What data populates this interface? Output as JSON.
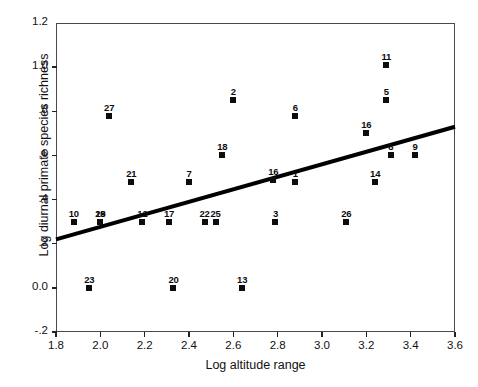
{
  "chart_data": {
    "type": "scatter",
    "title": "",
    "xlabel": "Log altitude range",
    "ylabel": "Log diurnal primate species richness",
    "xlim": [
      1.8,
      3.6
    ],
    "ylim": [
      -0.2,
      1.2
    ],
    "xticks": [
      "1.8",
      "2.0",
      "2.2",
      "2.4",
      "2.6",
      "2.8",
      "3.0",
      "3.2",
      "3.4",
      "3.6"
    ],
    "xtick_values": [
      1.8,
      2.0,
      2.2,
      2.4,
      2.6,
      2.8,
      3.0,
      3.2,
      3.4,
      3.6
    ],
    "yticks": [
      "1.2",
      "1.0",
      ".8",
      ".6",
      ".4",
      ".2",
      "0.0",
      "-.2"
    ],
    "ytick_values": [
      1.2,
      1.0,
      0.8,
      0.6,
      0.4,
      0.2,
      0.0,
      -0.2
    ],
    "grid": false,
    "legend": null,
    "marker": "filled-square",
    "marker_color": "#0d0d0d",
    "point_labels_shown": true,
    "points": [
      {
        "label": "10",
        "x": 1.88,
        "y": 0.3
      },
      {
        "label": "19",
        "x": 2.0,
        "y": 0.3
      },
      {
        "label": "28",
        "x": 2.0,
        "y": 0.3
      },
      {
        "label": "27",
        "x": 2.04,
        "y": 0.78
      },
      {
        "label": "23",
        "x": 1.95,
        "y": 0.0
      },
      {
        "label": "21",
        "x": 2.14,
        "y": 0.48
      },
      {
        "label": "12",
        "x": 2.19,
        "y": 0.3
      },
      {
        "label": "17",
        "x": 2.31,
        "y": 0.3
      },
      {
        "label": "20",
        "x": 2.33,
        "y": 0.0
      },
      {
        "label": "7",
        "x": 2.4,
        "y": 0.48
      },
      {
        "label": "22",
        "x": 2.47,
        "y": 0.3
      },
      {
        "label": "25",
        "x": 2.52,
        "y": 0.3
      },
      {
        "label": "18",
        "x": 2.55,
        "y": 0.6
      },
      {
        "label": "2",
        "x": 2.6,
        "y": 0.85
      },
      {
        "label": "13",
        "x": 2.64,
        "y": 0.0
      },
      {
        "label": "16",
        "x": 2.78,
        "y": 0.49
      },
      {
        "label": "3",
        "x": 2.79,
        "y": 0.3
      },
      {
        "label": "1",
        "x": 2.88,
        "y": 0.48
      },
      {
        "label": "6",
        "x": 2.88,
        "y": 0.78
      },
      {
        "label": "26",
        "x": 3.11,
        "y": 0.3
      },
      {
        "label": "16",
        "x": 3.2,
        "y": 0.7
      },
      {
        "label": "14",
        "x": 3.24,
        "y": 0.48
      },
      {
        "label": "11",
        "x": 3.29,
        "y": 1.01
      },
      {
        "label": "5",
        "x": 3.29,
        "y": 0.85
      },
      {
        "label": "8",
        "x": 3.31,
        "y": 0.6
      },
      {
        "label": "9",
        "x": 3.42,
        "y": 0.6
      }
    ],
    "regression_line": {
      "x_start": 1.8,
      "y_start": 0.22,
      "x_end": 3.6,
      "y_end": 0.73,
      "color": "#000000",
      "width_px": 4
    }
  }
}
